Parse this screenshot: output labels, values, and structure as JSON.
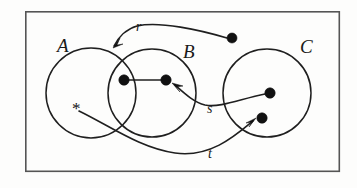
{
  "figure": {
    "kind": "set-relation-diagram",
    "background_color": "#fdfdfc",
    "ink_color": "#1f1f1f",
    "frame_color": "#555555",
    "frame": {
      "x": 25,
      "y": 11,
      "width": 315,
      "height": 161
    }
  },
  "sets": [
    {
      "id": "A",
      "label": "A",
      "label_x": 57,
      "label_y": 52,
      "cx": 91,
      "cy": 93,
      "r": 45
    },
    {
      "id": "B",
      "label": "B",
      "label_x": 183,
      "label_y": 58,
      "cx": 152,
      "cy": 93,
      "r": 44
    },
    {
      "id": "C",
      "label": "C",
      "label_x": 300,
      "label_y": 53,
      "cx": 267,
      "cy": 93,
      "r": 44
    }
  ],
  "points": [
    {
      "id": "p-r-source",
      "name": "dot-outside-top-right",
      "x": 232,
      "y": 38,
      "r": 5
    },
    {
      "id": "p-ab-left",
      "name": "dot-in-a-and-b-left",
      "x": 124,
      "y": 80,
      "r": 5.2
    },
    {
      "id": "p-b-right",
      "name": "dot-in-b-right",
      "x": 166,
      "y": 80,
      "r": 5.2
    },
    {
      "id": "p-c-upper",
      "name": "dot-in-c-upper",
      "x": 270,
      "y": 93,
      "r": 5.2
    },
    {
      "id": "p-c-lower",
      "name": "dot-in-c-lower",
      "x": 262,
      "y": 118,
      "r": 5.2
    }
  ],
  "marks": [
    {
      "id": "star-in-a",
      "glyph": "*",
      "x": 72,
      "y": 114
    }
  ],
  "relations": [
    {
      "id": "r",
      "label": "r",
      "label_x": 136,
      "label_y": 31,
      "from": "dot-outside-top-right",
      "to": "boundary-of-a-and-b-top-left",
      "path": "M 227 38 C 200 30 160 21 137 26 C 126 29 118 38 114 46",
      "arrow_at": {
        "x": 113,
        "y": 47,
        "angle": 115
      }
    },
    {
      "id": "s",
      "label": "s",
      "label_x": 207,
      "label_y": 113,
      "from": "dot-in-c-upper",
      "to": "dot-in-b-right",
      "path": "M 265 94 C 240 99 220 108 205 105 C 193 102 183 92 175 85",
      "arrow_at": {
        "x": 172,
        "y": 83,
        "angle": 220
      }
    },
    {
      "id": "t",
      "label": "t",
      "label_x": 208,
      "label_y": 158,
      "from": "star-in-a",
      "to": "dot-in-c-lower",
      "path": "M 79 111 C 110 126 140 148 175 153 C 210 158 235 136 253 121",
      "arrow_at": {
        "x": 256,
        "y": 118,
        "angle": 320
      }
    }
  ],
  "links": [
    {
      "id": "ab-left-to-b-right",
      "from": "dot-in-a-and-b-left",
      "to": "dot-in-b-right",
      "x1": 126,
      "y1": 80,
      "x2": 164,
      "y2": 80
    }
  ]
}
